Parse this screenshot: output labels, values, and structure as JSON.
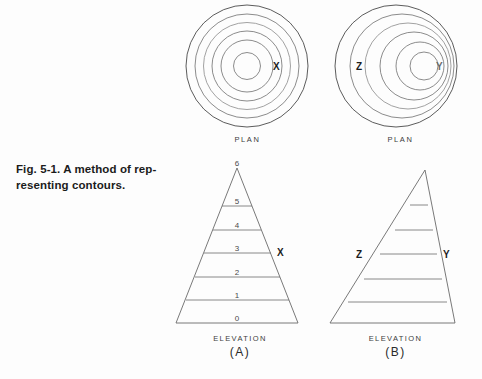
{
  "figure": {
    "caption_lines": [
      "Fig. 5-1. A method of rep-",
      "resenting contours."
    ],
    "caption_full": "Fig. 5-1. A method of representing contours."
  },
  "panels": {
    "plan_a": {
      "label": "PLAN",
      "point_labels": [
        "X"
      ],
      "ring_count": 6,
      "style": "concentric"
    },
    "plan_b": {
      "label": "PLAN",
      "point_labels": [
        "Z",
        "Y"
      ],
      "ring_count": 6,
      "style": "eccentric"
    },
    "elevation_a": {
      "label": "ELEVATION",
      "panel_id": "(A)",
      "level_numbers": [
        "6",
        "5",
        "4",
        "3",
        "2",
        "1",
        "0"
      ],
      "point_labels": [
        "X"
      ],
      "point_level": "3",
      "shape": "symmetric-triangle"
    },
    "elevation_b": {
      "label": "ELEVATION",
      "panel_id": "(B)",
      "level_numbers": [],
      "point_labels": [
        "Z",
        "Y"
      ],
      "shape": "asymmetric-triangle"
    }
  },
  "colors": {
    "background": "#fdfdfd",
    "ink": "#5a5a5a",
    "ink_dark": "#1d1d1d",
    "ink_faint": "#9a9a9a"
  }
}
